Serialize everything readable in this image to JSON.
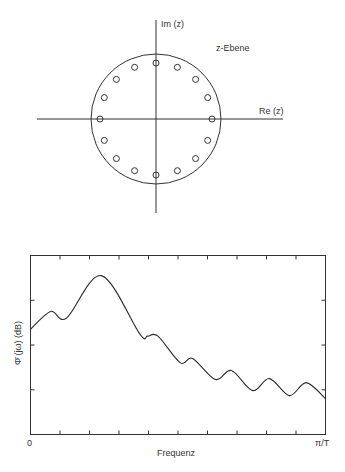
{
  "z_plane": {
    "title": "z-Ebene",
    "axis_im_label": "Im (z)",
    "axis_re_label": "Re (z)",
    "unit_circle": {
      "cx": 156,
      "cy": 119,
      "r": 64
    },
    "zeros_count": 16,
    "zeros_radius": 56,
    "zeros_marker": "open-circle"
  },
  "spectrum": {
    "ylabel": "Φ̄ (jω) (dB)",
    "xlabel": "Frequenz",
    "x_tick_start": "0",
    "x_tick_end": "π/T"
  },
  "chart_data": [
    {
      "type": "scatter",
      "title": "z-Ebene",
      "xlabel": "Re (z)",
      "ylabel": "Im (z)",
      "description": "16 zeros equally spaced (22.5°) on a circle of radius ≈0.875 inside the unit circle",
      "points_angle_deg": [
        0,
        22.5,
        45,
        67.5,
        90,
        112.5,
        135,
        157.5,
        180,
        202.5,
        225,
        247.5,
        270,
        292.5,
        315,
        337.5
      ],
      "radius": 0.875,
      "unit_circle": true,
      "grid": false
    },
    {
      "type": "line",
      "title": "",
      "xlabel": "Frequenz",
      "ylabel": "Φ̄ (jω) (dB)",
      "x_tick_labels": [
        "0",
        "π/T"
      ],
      "x_ticks": 10,
      "y_ticks": 4,
      "xlim": [
        0,
        1
      ],
      "ylim": [
        0,
        4
      ],
      "grid": false,
      "x": [
        0.0,
        0.068,
        0.122,
        0.24,
        0.37,
        0.397,
        0.432,
        0.508,
        0.549,
        0.627,
        0.681,
        0.753,
        0.81,
        0.878,
        0.935,
        1.0
      ],
      "values": [
        2.35,
        2.75,
        2.6,
        3.55,
        2.25,
        2.2,
        2.2,
        1.6,
        1.7,
        1.23,
        1.43,
        0.98,
        1.25,
        0.87,
        1.16,
        0.8
      ]
    }
  ]
}
